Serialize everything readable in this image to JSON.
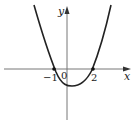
{
  "diagram": {
    "type": "function-graph",
    "function": "parabola opening upward",
    "axes": {
      "x_label": "x",
      "y_label": "y",
      "origin_label": "0"
    },
    "x_intercepts": [
      {
        "label": "−1",
        "value": -1
      },
      {
        "label": "2",
        "value": 2
      }
    ],
    "colors": {
      "axis": "#555555",
      "curve": "#222222",
      "point": "#111111"
    }
  }
}
